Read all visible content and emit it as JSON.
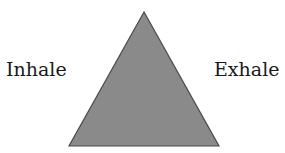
{
  "diagram": {
    "shape": "triangle",
    "labels": {
      "left": "Inhale",
      "right": "Exhale"
    },
    "triangle": {
      "points": "144,12 69,146 219,146",
      "fill": "#8a8a8a",
      "stroke": "#4a4a4a"
    },
    "background": "#ffffff"
  }
}
